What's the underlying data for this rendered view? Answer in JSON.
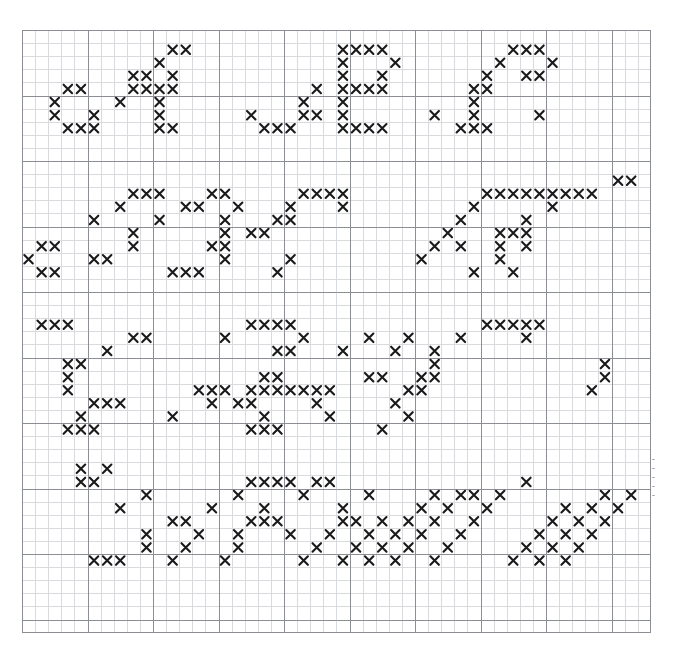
{
  "meta": {
    "symbol": "X",
    "symbol_color": "#1a1a1a",
    "background_color": "#ffffff"
  },
  "grid": {
    "columns": 48,
    "rows": 46,
    "cell_size": 13.1,
    "origin_x": 22,
    "origin_y": 30,
    "minor_line_color": "#d8dadd",
    "major_line_color": "#8b8e93",
    "border_color": "#8b8e93",
    "major_every": 5,
    "grid_visible": true
  },
  "margin_annotations": [
    "~",
    "~",
    "~",
    "~",
    "~"
  ],
  "chart_data": {
    "type": "heatmap",
    "xlabel": "",
    "ylabel": "",
    "legend": [],
    "columns": 48,
    "rows": 46,
    "symbol": "X",
    "letters": [
      {
        "name": "A",
        "band": 1,
        "origin": [
          1,
          0
        ]
      },
      {
        "name": "B",
        "band": 1,
        "origin": [
          16,
          0
        ]
      },
      {
        "name": "C",
        "band": 1,
        "origin": [
          32,
          0
        ]
      },
      {
        "name": "D",
        "band": 2,
        "origin": [
          1,
          11
        ]
      },
      {
        "name": "E",
        "band": 2,
        "origin": [
          17,
          11
        ]
      },
      {
        "name": "F",
        "band": 2,
        "origin": [
          33,
          11
        ]
      },
      {
        "name": "G",
        "band": 3,
        "origin": [
          1,
          22
        ]
      },
      {
        "name": "H",
        "band": 3,
        "origin": [
          17,
          22
        ]
      },
      {
        "name": "I",
        "band": 3,
        "origin": [
          33,
          22
        ]
      },
      {
        "name": "J",
        "band": 4,
        "origin": [
          1,
          33
        ]
      },
      {
        "name": "K",
        "band": 4,
        "origin": [
          17,
          33
        ]
      },
      {
        "name": "L",
        "band": 4,
        "origin": [
          33,
          33
        ]
      }
    ],
    "stitches": [
      [
        11,
        1
      ],
      [
        12,
        1
      ],
      [
        24,
        1
      ],
      [
        25,
        1
      ],
      [
        26,
        1
      ],
      [
        27,
        1
      ],
      [
        37,
        1
      ],
      [
        38,
        1
      ],
      [
        39,
        1
      ],
      [
        10,
        2
      ],
      [
        24,
        2
      ],
      [
        28,
        2
      ],
      [
        36,
        2
      ],
      [
        40,
        2
      ],
      [
        9,
        3
      ],
      [
        11,
        3
      ],
      [
        24,
        3
      ],
      [
        27,
        3
      ],
      [
        35,
        3
      ],
      [
        38,
        3
      ],
      [
        39,
        3
      ],
      [
        8,
        3
      ],
      [
        3,
        4
      ],
      [
        4,
        4
      ],
      [
        8,
        4
      ],
      [
        9,
        4
      ],
      [
        10,
        4
      ],
      [
        11,
        4
      ],
      [
        22,
        4
      ],
      [
        24,
        4
      ],
      [
        25,
        4
      ],
      [
        26,
        4
      ],
      [
        27,
        4
      ],
      [
        34,
        4
      ],
      [
        35,
        4
      ],
      [
        2,
        5
      ],
      [
        7,
        5
      ],
      [
        10,
        5
      ],
      [
        21,
        5
      ],
      [
        24,
        5
      ],
      [
        34,
        5
      ],
      [
        2,
        6
      ],
      [
        5,
        6
      ],
      [
        10,
        6
      ],
      [
        17,
        6
      ],
      [
        21,
        6
      ],
      [
        22,
        6
      ],
      [
        24,
        6
      ],
      [
        31,
        6
      ],
      [
        34,
        6
      ],
      [
        39,
        6
      ],
      [
        3,
        7
      ],
      [
        4,
        7
      ],
      [
        5,
        7
      ],
      [
        10,
        7
      ],
      [
        11,
        7
      ],
      [
        18,
        7
      ],
      [
        19,
        7
      ],
      [
        20,
        7
      ],
      [
        24,
        7
      ],
      [
        25,
        7
      ],
      [
        26,
        7
      ],
      [
        27,
        7
      ],
      [
        33,
        7
      ],
      [
        34,
        7
      ],
      [
        35,
        7
      ],
      [
        45,
        11
      ],
      [
        46,
        11
      ],
      [
        8,
        12
      ],
      [
        9,
        12
      ],
      [
        10,
        12
      ],
      [
        14,
        12
      ],
      [
        15,
        12
      ],
      [
        21,
        12
      ],
      [
        22,
        12
      ],
      [
        23,
        12
      ],
      [
        24,
        12
      ],
      [
        35,
        12
      ],
      [
        36,
        12
      ],
      [
        37,
        12
      ],
      [
        38,
        12
      ],
      [
        39,
        12
      ],
      [
        40,
        12
      ],
      [
        41,
        12
      ],
      [
        42,
        12
      ],
      [
        43,
        12
      ],
      [
        7,
        13
      ],
      [
        12,
        13
      ],
      [
        13,
        13
      ],
      [
        16,
        13
      ],
      [
        20,
        13
      ],
      [
        24,
        13
      ],
      [
        34,
        13
      ],
      [
        40,
        13
      ],
      [
        5,
        14
      ],
      [
        10,
        14
      ],
      [
        15,
        14
      ],
      [
        19,
        14
      ],
      [
        20,
        14
      ],
      [
        33,
        14
      ],
      [
        38,
        14
      ],
      [
        8,
        15
      ],
      [
        15,
        15
      ],
      [
        17,
        15
      ],
      [
        18,
        15
      ],
      [
        32,
        15
      ],
      [
        36,
        15
      ],
      [
        37,
        15
      ],
      [
        38,
        15
      ],
      [
        1,
        16
      ],
      [
        2,
        16
      ],
      [
        8,
        16
      ],
      [
        15,
        16
      ],
      [
        14,
        16
      ],
      [
        31,
        16
      ],
      [
        33,
        16
      ],
      [
        36,
        16
      ],
      [
        38,
        16
      ],
      [
        0,
        17
      ],
      [
        5,
        17
      ],
      [
        6,
        17
      ],
      [
        15,
        17
      ],
      [
        20,
        17
      ],
      [
        30,
        17
      ],
      [
        36,
        17
      ],
      [
        1,
        18
      ],
      [
        2,
        18
      ],
      [
        11,
        18
      ],
      [
        12,
        18
      ],
      [
        13,
        18
      ],
      [
        19,
        18
      ],
      [
        34,
        18
      ],
      [
        37,
        18
      ],
      [
        1,
        22
      ],
      [
        2,
        22
      ],
      [
        3,
        22
      ],
      [
        17,
        22
      ],
      [
        18,
        22
      ],
      [
        19,
        22
      ],
      [
        20,
        22
      ],
      [
        35,
        22
      ],
      [
        36,
        22
      ],
      [
        37,
        22
      ],
      [
        38,
        22
      ],
      [
        39,
        22
      ],
      [
        8,
        23
      ],
      [
        9,
        23
      ],
      [
        15,
        23
      ],
      [
        21,
        23
      ],
      [
        26,
        23
      ],
      [
        29,
        23
      ],
      [
        33,
        23
      ],
      [
        38,
        23
      ],
      [
        6,
        24
      ],
      [
        19,
        24
      ],
      [
        20,
        24
      ],
      [
        24,
        24
      ],
      [
        28,
        24
      ],
      [
        31,
        24
      ],
      [
        3,
        25
      ],
      [
        4,
        25
      ],
      [
        31,
        25
      ],
      [
        44,
        25
      ],
      [
        3,
        26
      ],
      [
        18,
        26
      ],
      [
        19,
        26
      ],
      [
        26,
        26
      ],
      [
        27,
        26
      ],
      [
        30,
        26
      ],
      [
        31,
        26
      ],
      [
        44,
        26
      ],
      [
        3,
        27
      ],
      [
        13,
        27
      ],
      [
        14,
        27
      ],
      [
        15,
        27
      ],
      [
        17,
        27
      ],
      [
        18,
        27
      ],
      [
        19,
        27
      ],
      [
        20,
        27
      ],
      [
        21,
        27
      ],
      [
        22,
        27
      ],
      [
        23,
        27
      ],
      [
        29,
        27
      ],
      [
        30,
        27
      ],
      [
        43,
        27
      ],
      [
        5,
        28
      ],
      [
        6,
        28
      ],
      [
        7,
        28
      ],
      [
        14,
        28
      ],
      [
        16,
        28
      ],
      [
        17,
        28
      ],
      [
        22,
        28
      ],
      [
        28,
        28
      ],
      [
        4,
        29
      ],
      [
        11,
        29
      ],
      [
        18,
        29
      ],
      [
        23,
        29
      ],
      [
        29,
        29
      ],
      [
        3,
        30
      ],
      [
        4,
        30
      ],
      [
        5,
        30
      ],
      [
        17,
        30
      ],
      [
        18,
        30
      ],
      [
        19,
        30
      ],
      [
        27,
        30
      ],
      [
        4,
        33
      ],
      [
        6,
        33
      ],
      [
        4,
        34
      ],
      [
        5,
        34
      ],
      [
        17,
        34
      ],
      [
        18,
        34
      ],
      [
        19,
        34
      ],
      [
        20,
        34
      ],
      [
        22,
        34
      ],
      [
        23,
        34
      ],
      [
        38,
        34
      ],
      [
        9,
        35
      ],
      [
        16,
        35
      ],
      [
        21,
        35
      ],
      [
        26,
        35
      ],
      [
        31,
        35
      ],
      [
        33,
        35
      ],
      [
        34,
        35
      ],
      [
        36,
        35
      ],
      [
        44,
        35
      ],
      [
        46,
        35
      ],
      [
        7,
        36
      ],
      [
        14,
        36
      ],
      [
        18,
        36
      ],
      [
        24,
        36
      ],
      [
        30,
        36
      ],
      [
        32,
        36
      ],
      [
        35,
        36
      ],
      [
        41,
        36
      ],
      [
        43,
        36
      ],
      [
        45,
        36
      ],
      [
        11,
        37
      ],
      [
        12,
        37
      ],
      [
        17,
        37
      ],
      [
        18,
        37
      ],
      [
        19,
        37
      ],
      [
        24,
        37
      ],
      [
        25,
        37
      ],
      [
        27,
        37
      ],
      [
        29,
        37
      ],
      [
        31,
        37
      ],
      [
        34,
        37
      ],
      [
        40,
        37
      ],
      [
        42,
        37
      ],
      [
        44,
        37
      ],
      [
        9,
        38
      ],
      [
        13,
        38
      ],
      [
        16,
        38
      ],
      [
        20,
        38
      ],
      [
        23,
        38
      ],
      [
        26,
        38
      ],
      [
        28,
        38
      ],
      [
        30,
        38
      ],
      [
        33,
        38
      ],
      [
        39,
        38
      ],
      [
        41,
        38
      ],
      [
        43,
        38
      ],
      [
        9,
        39
      ],
      [
        12,
        39
      ],
      [
        16,
        39
      ],
      [
        22,
        39
      ],
      [
        25,
        39
      ],
      [
        27,
        39
      ],
      [
        29,
        39
      ],
      [
        32,
        39
      ],
      [
        38,
        39
      ],
      [
        40,
        39
      ],
      [
        42,
        39
      ],
      [
        5,
        40
      ],
      [
        6,
        40
      ],
      [
        7,
        40
      ],
      [
        11,
        40
      ],
      [
        15,
        40
      ],
      [
        21,
        40
      ],
      [
        24,
        40
      ],
      [
        26,
        40
      ],
      [
        28,
        40
      ],
      [
        31,
        40
      ],
      [
        37,
        40
      ],
      [
        39,
        40
      ],
      [
        41,
        40
      ]
    ]
  }
}
